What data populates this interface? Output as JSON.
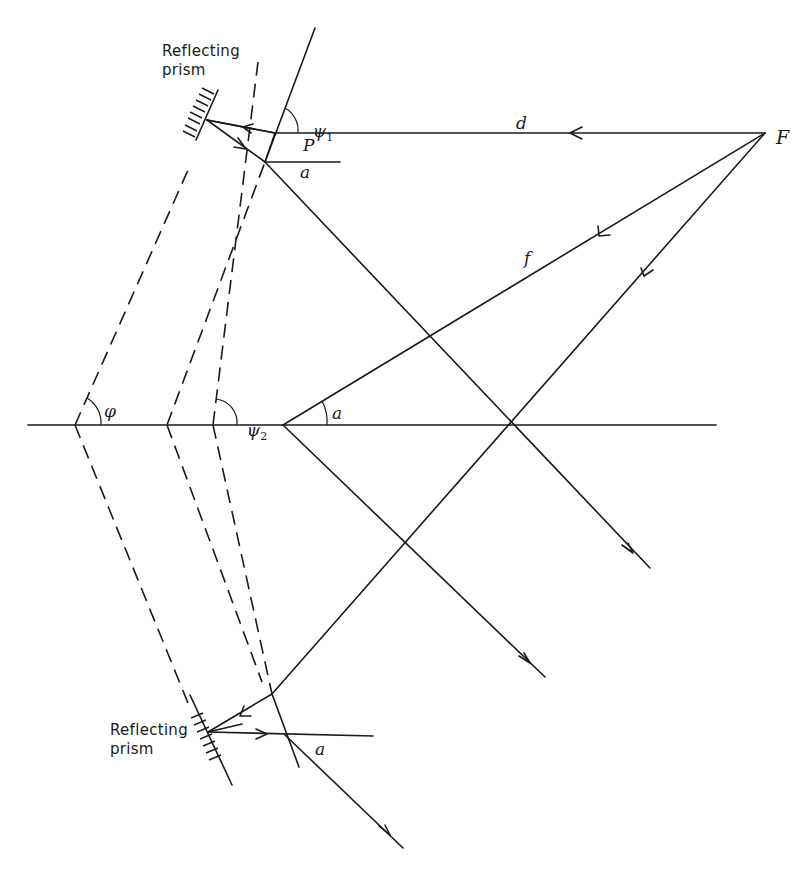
{
  "labels": {
    "prism_top": "Reflecting\nprism",
    "prism_bottom": "Reflecting\nprism",
    "d": "d",
    "F": "F",
    "f": "f",
    "P": "P",
    "alpha_top": "a",
    "alpha_center": "a",
    "alpha_bottom": "a",
    "psi1": "ψ",
    "psi1_sub": "1",
    "psi2": "ψ",
    "psi2_sub": "2",
    "phi": "φ"
  },
  "colors": {
    "ink": "#1a1a1a",
    "background": "#ffffff"
  }
}
